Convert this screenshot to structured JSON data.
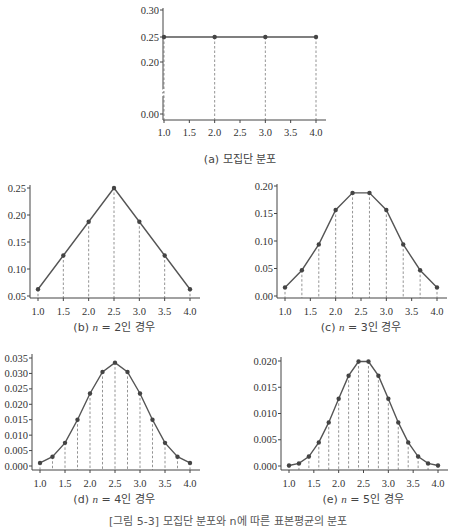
{
  "figure_caption": "[그림 5-3] 모집단 분포와 n에 따른 표본평균의 분포",
  "chart_data": [
    {
      "id": "a",
      "type": "line",
      "caption": "(a) 모집단 분포",
      "x": [
        1.0,
        2.0,
        3.0,
        4.0
      ],
      "values": [
        0.25,
        0.25,
        0.25,
        0.25
      ],
      "xticks": [
        "1.0",
        "1.5",
        "2.0",
        "2.5",
        "3.0",
        "3.5",
        "4.0"
      ],
      "yticks": [
        "0.00",
        "0.20",
        "0.25",
        "0.30"
      ],
      "xlim": [
        1.0,
        4.0
      ],
      "ylim": [
        0.0,
        0.3
      ],
      "axis_break": true,
      "dashed_droplines": true
    },
    {
      "id": "b",
      "type": "line",
      "caption": "(b) n = 2인 경우",
      "x": [
        1.0,
        1.5,
        2.0,
        2.5,
        3.0,
        3.5,
        4.0
      ],
      "values": [
        0.0625,
        0.125,
        0.1875,
        0.25,
        0.1875,
        0.125,
        0.0625
      ],
      "xticks": [
        "1.0",
        "1.5",
        "2.0",
        "2.5",
        "3.0",
        "3.5",
        "4.0"
      ],
      "yticks": [
        "0.05",
        "0.10",
        "0.15",
        "0.20",
        "0.25"
      ],
      "xlim": [
        1.0,
        4.0
      ],
      "ylim": [
        0.05,
        0.25
      ],
      "dashed_droplines": true
    },
    {
      "id": "c",
      "type": "line",
      "caption": "(c) n = 3인 경우",
      "x": [
        1.0,
        1.333,
        1.667,
        2.0,
        2.333,
        2.667,
        3.0,
        3.333,
        3.667,
        4.0
      ],
      "values": [
        0.0156,
        0.0469,
        0.0938,
        0.1563,
        0.1875,
        0.1875,
        0.1563,
        0.0938,
        0.0469,
        0.0156
      ],
      "xticks": [
        "1.0",
        "1.5",
        "2.0",
        "2.5",
        "3.0",
        "3.5",
        "4.0"
      ],
      "yticks": [
        "0.00",
        "0.05",
        "0.10",
        "0.15",
        "0.20"
      ],
      "xlim": [
        1.0,
        4.0
      ],
      "ylim": [
        0.0,
        0.2
      ],
      "dashed_droplines": true
    },
    {
      "id": "d",
      "type": "line",
      "caption": "(d) n = 4인 경우",
      "x": [
        1.0,
        1.25,
        1.5,
        1.75,
        2.0,
        2.25,
        2.5,
        2.75,
        3.0,
        3.25,
        3.5,
        3.75,
        4.0
      ],
      "values": [
        0.001,
        0.003,
        0.0075,
        0.015,
        0.0235,
        0.0305,
        0.0335,
        0.0305,
        0.0235,
        0.015,
        0.0075,
        0.003,
        0.001
      ],
      "xticks": [
        "1.0",
        "1.5",
        "2.0",
        "2.5",
        "3.0",
        "3.5",
        "4.0"
      ],
      "yticks": [
        "0.000",
        "0.005",
        "0.010",
        "0.015",
        "0.020",
        "0.025",
        "0.030",
        "0.035"
      ],
      "xlim": [
        1.0,
        4.0
      ],
      "ylim": [
        0.0,
        0.035
      ],
      "dashed_droplines": true
    },
    {
      "id": "e",
      "type": "line",
      "caption": "(e) n = 5인 경우",
      "x": [
        1.0,
        1.2,
        1.4,
        1.6,
        1.8,
        2.0,
        2.2,
        2.4,
        2.6,
        2.8,
        3.0,
        3.2,
        3.4,
        3.6,
        3.8,
        4.0
      ],
      "values": [
        0.0001,
        0.0005,
        0.0018,
        0.0045,
        0.0083,
        0.0128,
        0.0172,
        0.0199,
        0.0199,
        0.0172,
        0.0128,
        0.0083,
        0.0045,
        0.0018,
        0.0005,
        0.0001
      ],
      "xticks": [
        "1.0",
        "1.5",
        "2.0",
        "2.5",
        "3.0",
        "3.5",
        "4.0"
      ],
      "yticks": [
        "0.000",
        "0.005",
        "0.010",
        "0.015",
        "0.020"
      ],
      "xlim": [
        1.0,
        4.0
      ],
      "ylim": [
        0.0,
        0.02
      ],
      "dashed_droplines": true
    }
  ],
  "layout": [
    {
      "ax_x": 163,
      "x0": 164,
      "x1": 316,
      "y_axis": 120,
      "ytop": 8,
      "ymap": [
        [
          0.0,
          114
        ],
        [
          0.2,
          62
        ],
        [
          0.25,
          37
        ],
        [
          0.3,
          10
        ]
      ],
      "cap_x": 240,
      "cap_y": 150,
      "tick_y": 132
    },
    {
      "ax_x": 30,
      "x0": 38,
      "x1": 190,
      "y_axis": 298,
      "ytop": 185,
      "ymap": [
        [
          0.05,
          296
        ],
        [
          0.25,
          188
        ]
      ],
      "cap_x": 114,
      "cap_y": 318,
      "tick_y": 311
    },
    {
      "ax_x": 277,
      "x0": 285,
      "x1": 437,
      "y_axis": 298,
      "ytop": 184,
      "ymap": [
        [
          0.0,
          296
        ],
        [
          0.2,
          186
        ]
      ],
      "cap_x": 361,
      "cap_y": 318,
      "tick_y": 311
    },
    {
      "ax_x": 32,
      "x0": 40,
      "x1": 190,
      "y_axis": 470,
      "ytop": 354,
      "ymap": [
        [
          0.0,
          466
        ],
        [
          0.035,
          358
        ]
      ],
      "cap_x": 114,
      "cap_y": 490,
      "tick_y": 483
    },
    {
      "ax_x": 281,
      "x0": 289,
      "x1": 438,
      "y_axis": 470,
      "ytop": 357,
      "ymap": [
        [
          0.0,
          466
        ],
        [
          0.02,
          361
        ]
      ],
      "cap_x": 363,
      "cap_y": 490,
      "tick_y": 483
    }
  ],
  "colors": {
    "line": "#555555",
    "marker": "#444444",
    "dash": "#666666",
    "axis": "#444444"
  }
}
